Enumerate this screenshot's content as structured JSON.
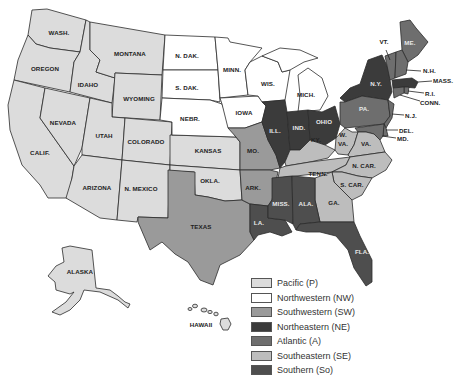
{
  "colors": {
    "P": "#dcdcdc",
    "NW": "#ffffff",
    "SW": "#9a9a9a",
    "NE": "#3b3b3b",
    "A": "#6e6e6e",
    "SE": "#bdbdbd",
    "So": "#4e4e4e"
  },
  "legend": [
    {
      "key": "P",
      "label": "Pacific (P)"
    },
    {
      "key": "NW",
      "label": "Northwestern (NW)"
    },
    {
      "key": "SW",
      "label": "Southwestern (SW)"
    },
    {
      "key": "NE",
      "label": "Northeastern (NE)"
    },
    {
      "key": "A",
      "label": "Atlantic (A)"
    },
    {
      "key": "SE",
      "label": "Southeastern (SE)"
    },
    {
      "key": "So",
      "label": "Southern (So)"
    }
  ],
  "states": {
    "wash": {
      "label": "WASH.",
      "region": "P"
    },
    "oregon": {
      "label": "OREGON",
      "region": "P"
    },
    "calif": {
      "label": "CALIF.",
      "region": "P"
    },
    "idaho": {
      "label": "IDAHO",
      "region": "P"
    },
    "nevada": {
      "label": "NEVADA",
      "region": "P"
    },
    "montana": {
      "label": "MONTANA",
      "region": "P"
    },
    "wyoming": {
      "label": "WYOMING",
      "region": "P"
    },
    "utah": {
      "label": "UTAH",
      "region": "P"
    },
    "colorado": {
      "label": "COLORADO",
      "region": "P"
    },
    "arizona": {
      "label": "ARIZONA",
      "region": "P"
    },
    "nmexico": {
      "label": "N. MEXICO",
      "region": "P"
    },
    "kansas": {
      "label": "KANSAS",
      "region": "P"
    },
    "okla": {
      "label": "OKLA.",
      "region": "P"
    },
    "alaska": {
      "label": "ALASKA",
      "region": "P"
    },
    "hawaii": {
      "label": "HAWAII",
      "region": "P"
    },
    "ndak": {
      "label": "N. DAK.",
      "region": "NW"
    },
    "sdak": {
      "label": "S. DAK.",
      "region": "NW"
    },
    "nebr": {
      "label": "NEBR.",
      "region": "NW"
    },
    "minn": {
      "label": "MINN.",
      "region": "NW"
    },
    "iowa": {
      "label": "IOWA",
      "region": "NW"
    },
    "wis": {
      "label": "WIS.",
      "region": "NW"
    },
    "mich": {
      "label": "MICH.",
      "region": "NW"
    },
    "texas": {
      "label": "TEXAS",
      "region": "SW"
    },
    "mo": {
      "label": "MO.",
      "region": "SW"
    },
    "ark": {
      "label": "ARK.",
      "region": "SW"
    },
    "ill": {
      "label": "ILL.",
      "region": "NE"
    },
    "ind": {
      "label": "IND.",
      "region": "NE"
    },
    "ohio": {
      "label": "OHIO",
      "region": "NE"
    },
    "ny": {
      "label": "N.Y.",
      "region": "NE"
    },
    "mass": {
      "label": "MASS.",
      "region": "NE"
    },
    "me": {
      "label": "ME.",
      "region": "A"
    },
    "vt": {
      "label": "VT.",
      "region": "A"
    },
    "nh": {
      "label": "N.H.",
      "region": "A"
    },
    "ri": {
      "label": "R.I.",
      "region": "A"
    },
    "conn": {
      "label": "CONN.",
      "region": "A"
    },
    "nj": {
      "label": "N.J.",
      "region": "A"
    },
    "pa": {
      "label": "PA.",
      "region": "A"
    },
    "del": {
      "label": "DEL.",
      "region": "A"
    },
    "md": {
      "label": "MD.",
      "region": "A"
    },
    "ky": {
      "label": "KY.",
      "region": "SE"
    },
    "tenn": {
      "label": "TENN.",
      "region": "SE"
    },
    "wva": {
      "label": "W. VA.",
      "region": "SE"
    },
    "va": {
      "label": "VA.",
      "region": "SE"
    },
    "ncar": {
      "label": "N. CAR.",
      "region": "SE"
    },
    "scar": {
      "label": "S. CAR.",
      "region": "SE"
    },
    "ga": {
      "label": "GA.",
      "region": "SE"
    },
    "la": {
      "label": "LA.",
      "region": "So"
    },
    "miss": {
      "label": "MISS.",
      "region": "So"
    },
    "ala": {
      "label": "ALA.",
      "region": "So"
    },
    "fla": {
      "label": "FLA.",
      "region": "So"
    }
  }
}
